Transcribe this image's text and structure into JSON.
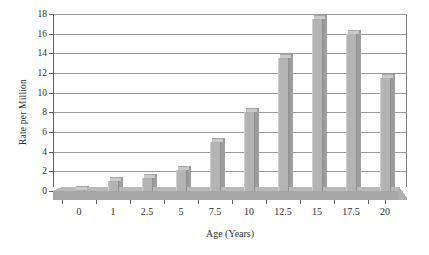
{
  "chart_data": {
    "type": "bar",
    "title": "",
    "subtitle": "",
    "xlabel": "Age (Years)",
    "ylabel": "Rate per Million",
    "categories": [
      "0",
      "1",
      "2.5",
      "5",
      "7.5",
      "10",
      "12.5",
      "15",
      "17.5",
      "20"
    ],
    "values": [
      0.1,
      1.0,
      1.3,
      2.1,
      5.0,
      8.0,
      13.5,
      17.5,
      16.0,
      11.5
    ],
    "ylim": [
      0,
      18
    ],
    "ytick_labels": [
      "0",
      "2",
      "4",
      "6",
      "8",
      "10",
      "12",
      "14",
      "16",
      "18"
    ],
    "ytick_values": [
      0,
      2,
      4,
      6,
      8,
      10,
      12,
      14,
      16,
      18
    ],
    "grid": true,
    "legend": false,
    "legend_position": "none",
    "bar_color": "#b4b4b4",
    "bar_top_color": "#c9c9c9",
    "bar_side_color": "#9d9d9d",
    "axis_color": "#5f5f5f",
    "grid_color": "#9a9a9a",
    "floor_color": "#a6a6a6",
    "background": "#ffffff",
    "style": "3d-column"
  }
}
